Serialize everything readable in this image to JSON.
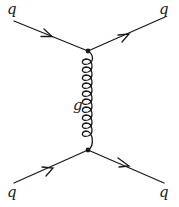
{
  "diagram": {
    "type": "feynman",
    "labels": {
      "top_left": "q",
      "top_right": "q",
      "bottom_left": "q",
      "bottom_right": "q",
      "propagator": "g"
    },
    "line_color": "#1a1a1a",
    "vertices": [
      {
        "x": 88,
        "y": 51
      },
      {
        "x": 88,
        "y": 150
      }
    ],
    "gluon_loops": 7
  }
}
